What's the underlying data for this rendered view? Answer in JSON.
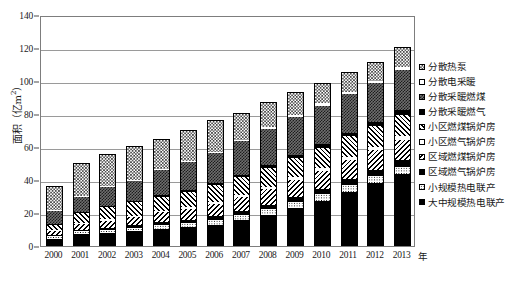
{
  "chart_data": {
    "type": "bar",
    "subtype": "stacked-vertical",
    "title": "",
    "xlabel": "年",
    "ylabel": "面积（亿m²）",
    "ylim": [
      0,
      140
    ],
    "yticks": [
      0,
      20,
      40,
      60,
      80,
      100,
      120,
      140
    ],
    "grid": true,
    "legend_position": "right",
    "categories": [
      "2000",
      "2001",
      "2002",
      "2003",
      "2004",
      "2005",
      "2006",
      "2007",
      "2008",
      "2009",
      "2010",
      "2011",
      "2012",
      "2013"
    ],
    "series": [
      {
        "name": "大中规模热电联产",
        "pattern": "solid-black",
        "values": [
          4.5,
          7.0,
          8.0,
          9.0,
          10.5,
          11.5,
          13.0,
          15.5,
          19.0,
          23.0,
          27.5,
          33.0,
          38.0,
          43.5
        ]
      },
      {
        "name": "小规模热电联产",
        "pattern": "dots-fine",
        "values": [
          1.5,
          1.8,
          2.0,
          2.2,
          2.5,
          2.7,
          3.0,
          3.2,
          3.5,
          3.7,
          4.0,
          4.2,
          4.5,
          4.5
        ]
      },
      {
        "name": "区域燃气锅炉房",
        "pattern": "solid-black",
        "values": [
          0.8,
          1.0,
          1.2,
          1.4,
          1.6,
          1.8,
          2.0,
          2.3,
          2.6,
          2.9,
          3.2,
          3.5,
          3.8,
          4.0
        ]
      },
      {
        "name": "区域燃煤锅炉房",
        "pattern": "diag-back",
        "values": [
          2.5,
          3.5,
          4.2,
          5.0,
          5.8,
          6.5,
          7.5,
          8.5,
          9.5,
          10.5,
          11.0,
          11.5,
          12.0,
          12.5
        ]
      },
      {
        "name": "小区燃气锅炉房",
        "pattern": "white",
        "values": [
          0.5,
          0.6,
          0.7,
          0.8,
          0.9,
          1.0,
          1.1,
          1.2,
          1.4,
          1.5,
          1.6,
          1.8,
          2.0,
          2.2
        ]
      },
      {
        "name": "小区燃煤锅炉房",
        "pattern": "diag-fwd",
        "values": [
          3.2,
          6.1,
          7.4,
          8.1,
          8.7,
          9.5,
          10.4,
          11.0,
          11.5,
          12.0,
          12.4,
          12.5,
          12.5,
          13.0
        ]
      },
      {
        "name": "分散采暖燃气",
        "pattern": "solid-black",
        "values": [
          0.5,
          0.6,
          0.7,
          0.8,
          0.9,
          1.0,
          1.2,
          1.4,
          1.6,
          1.8,
          2.0,
          2.2,
          2.4,
          2.6
        ]
      },
      {
        "name": "分散采暖燃煤",
        "pattern": "dkgray-check",
        "values": [
          8.0,
          9.4,
          11.8,
          12.5,
          15.1,
          17.0,
          18.1,
          20.4,
          21.8,
          22.6,
          23.3,
          23.3,
          23.3,
          24.2
        ]
      },
      {
        "name": "分散电采暖",
        "pattern": "white",
        "values": [
          0.5,
          0.5,
          0.5,
          0.5,
          0.5,
          0.6,
          0.7,
          0.8,
          1.0,
          1.2,
          1.4,
          1.6,
          1.8,
          2.0
        ]
      },
      {
        "name": "分散热泵",
        "pattern": "ltgray-check",
        "values": [
          14.5,
          20.0,
          19.5,
          20.3,
          18.5,
          18.9,
          19.5,
          16.2,
          15.1,
          14.3,
          12.6,
          11.9,
          11.2,
          12.0
        ]
      }
    ],
    "totals": [
      36.5,
      50.5,
      56.0,
      60.5,
      65.0,
      70.5,
      76.5,
      80.5,
      86.0,
      93.5,
      99.0,
      105.5,
      111.5,
      120.5
    ]
  },
  "legend": {
    "items": [
      {
        "label": "分散热泵",
        "pattern": "ltgray-check"
      },
      {
        "label": "分散电采暖",
        "pattern": "white"
      },
      {
        "label": "分散采暖燃煤",
        "pattern": "dkgray-check"
      },
      {
        "label": "分散采暖燃气",
        "pattern": "solid-black"
      },
      {
        "label": "小区燃煤锅炉房",
        "pattern": "diag-fwd"
      },
      {
        "label": "小区燃气锅炉房",
        "pattern": "white"
      },
      {
        "label": "区域燃煤锅炉房",
        "pattern": "diag-back"
      },
      {
        "label": "区域燃气锅炉房",
        "pattern": "solid-black"
      },
      {
        "label": "小规模热电联产",
        "pattern": "dots-fine"
      },
      {
        "label": "大中规模热电联产",
        "pattern": "solid-black"
      }
    ]
  },
  "axes": {
    "y_title_main": "面积（亿m",
    "y_title_sup": "2",
    "y_title_tail": "）",
    "x_unit": "年"
  },
  "colors": {
    "frame": "#7d7d7d",
    "gridline": "#9a9a9a",
    "ink": "#000000",
    "background": "#ffffff"
  }
}
